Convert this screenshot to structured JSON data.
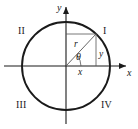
{
  "figure": {
    "type": "unit-circle-trigonometry-diagram",
    "colors": {
      "stroke": "#1a1a1a",
      "thin_stroke": "#555555",
      "background": "#ffffff"
    },
    "axes": {
      "x_label": "x",
      "y_label": "y"
    },
    "quadrants": [
      {
        "key": "q1",
        "label": "I"
      },
      {
        "key": "q2",
        "label": "II"
      },
      {
        "key": "q3",
        "label": "III"
      },
      {
        "key": "q4",
        "label": "IV"
      }
    ],
    "annotations": {
      "radius_label": "r",
      "angle_label": "θ",
      "opposite_label": "y",
      "adjacent_label": "x"
    },
    "geometry": {
      "center_x": 66,
      "center_y": 66,
      "radius": 44,
      "point_x": 96,
      "point_y": 34,
      "arc_radius": 15
    }
  }
}
